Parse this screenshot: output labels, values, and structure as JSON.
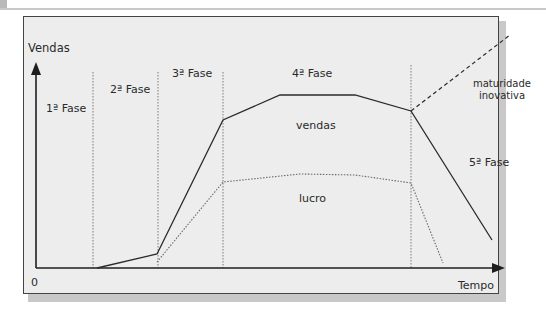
{
  "diagram": {
    "y_axis_label": "Vendas",
    "x_axis_label": "Tempo",
    "origin_label": "0",
    "phases": [
      {
        "label": "1ª Fase"
      },
      {
        "label": "2ª Fase"
      },
      {
        "label": "3ª Fase"
      },
      {
        "label": "4ª Fase"
      },
      {
        "label": "5ª Fase"
      }
    ],
    "curves": {
      "sales_label": "vendas",
      "profit_label": "lucro",
      "innovation_label_line1": "maturidade",
      "innovation_label_line2": "inovativa"
    },
    "colors": {
      "background": "#ededed",
      "line": "#2a2a2a",
      "dotted": "#7a7a7a",
      "frame": "#444444",
      "shadow": "#c9c9c9"
    }
  }
}
